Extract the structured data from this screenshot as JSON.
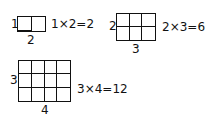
{
  "diagrams": [
    {
      "rows": 1,
      "cols": 2,
      "row_label": "1",
      "col_label": "2",
      "equation": "1×2=2"
    },
    {
      "rows": 2,
      "cols": 3,
      "row_label": "2",
      "col_label": "3",
      "equation": "2×3=6"
    },
    {
      "rows": 3,
      "cols": 4,
      "row_label": "3",
      "col_label": "4",
      "equation": "3×4=12"
    }
  ],
  "colors": {
    "line": "#111111",
    "background": "#ffffff"
  }
}
